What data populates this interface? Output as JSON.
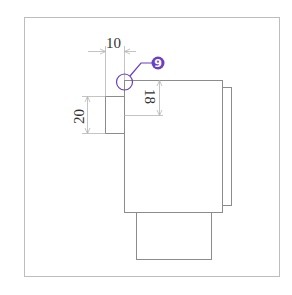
{
  "drawing": {
    "dimensions": [
      {
        "id": "width-top",
        "label": "10",
        "orientation": "horizontal"
      },
      {
        "id": "height-left",
        "label": "20",
        "orientation": "vertical"
      },
      {
        "id": "height-inner",
        "label": "18",
        "orientation": "vertical"
      }
    ],
    "callout": {
      "number": "9",
      "color": "#6a3fc4"
    },
    "colors": {
      "frame": "#b8b8b8",
      "outline": "#8c8c8c",
      "dimension": "#b0b0b0",
      "text": "#333333",
      "accent": "#6a3fc4"
    }
  }
}
